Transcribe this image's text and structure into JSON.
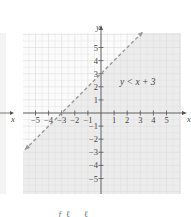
{
  "chart_data": {
    "type": "line",
    "title": "",
    "xlabel": "x",
    "ylabel": "y",
    "xlim": [
      -6,
      6
    ],
    "ylim": [
      -6,
      6
    ],
    "grid": true,
    "x_ticks": [
      -5,
      -4,
      -3,
      -2,
      -1,
      1,
      2,
      3,
      4,
      5
    ],
    "y_ticks": [
      -5,
      -4,
      -3,
      -2,
      -1,
      1,
      2,
      3,
      4,
      5
    ],
    "x_tick_labels": [
      "−5",
      "−4",
      "−3",
      "−2",
      "−1",
      "1",
      "2",
      "3",
      "4",
      "5"
    ],
    "y_tick_labels": [
      "−5",
      "−4",
      "−3",
      "−2",
      "−1",
      "1",
      "2",
      "3",
      "4",
      "5"
    ],
    "series": [
      {
        "name": "boundary y = x + 3",
        "style": "dashed",
        "slope": 1,
        "intercept": 3,
        "x": [
          -5.8,
          3.2
        ],
        "y": [
          -2.8,
          6.2
        ]
      }
    ],
    "shaded_region": "below the line (y < x + 3)",
    "annotations": [
      {
        "text": "y < x + 3",
        "x": 1.5,
        "y": 2.5
      }
    ],
    "colors": {
      "line": "#999999",
      "shade": "#ececec",
      "grid": "#dcdcdc",
      "axis": "#555555"
    }
  },
  "labels": {
    "x_axis": "x",
    "y_axis": "y",
    "inequality": "y < x + 3",
    "left_panel_x_axis": "x"
  }
}
